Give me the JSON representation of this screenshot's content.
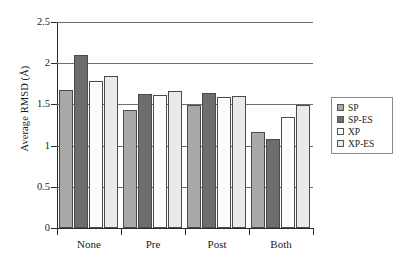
{
  "chart_data": {
    "type": "bar",
    "title": "",
    "xlabel": "",
    "ylabel": "Average RMSD (Å)",
    "categories": [
      "None",
      "Pre",
      "Post",
      "Both"
    ],
    "series": [
      {
        "name": "SP",
        "color": "#a9a9a9",
        "values": [
          1.68,
          1.43,
          1.49,
          1.16
        ]
      },
      {
        "name": "SP-ES",
        "color": "#6e6e6e",
        "values": [
          2.1,
          1.63,
          1.64,
          1.08
        ]
      },
      {
        "name": "XP",
        "color": "#ffffff",
        "values": [
          1.78,
          1.61,
          1.59,
          1.35
        ]
      },
      {
        "name": "XP-ES",
        "color": "#eaeaea",
        "values": [
          1.84,
          1.66,
          1.6,
          1.49
        ]
      }
    ],
    "ylim": [
      0,
      2.5
    ],
    "y_ticks": [
      0,
      0.5,
      1,
      1.5,
      2,
      2.5
    ],
    "y_tick_labels": [
      "0",
      "0.5",
      "1",
      "1.5",
      "2",
      "2.5"
    ],
    "grid": true,
    "grid_axis": "y",
    "legend_position": "right"
  }
}
